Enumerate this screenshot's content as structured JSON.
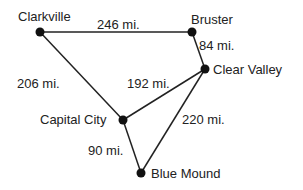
{
  "diagram": {
    "type": "weighted-graph",
    "colors": {
      "edge": "#222222",
      "node": "#111111",
      "text": "#222222",
      "background": "#ffffff"
    },
    "nodes": [
      {
        "id": "clarkville",
        "label": "Clarkville"
      },
      {
        "id": "bruster",
        "label": "Bruster"
      },
      {
        "id": "clear_valley",
        "label": "Clear Valley"
      },
      {
        "id": "capital_city",
        "label": "Capital City"
      },
      {
        "id": "blue_mound",
        "label": "Blue Mound"
      }
    ],
    "edges": [
      {
        "from": "Clarkville",
        "to": "Bruster",
        "label": "246 mi."
      },
      {
        "from": "Bruster",
        "to": "Clear Valley",
        "label": "84 mi."
      },
      {
        "from": "Clarkville",
        "to": "Capital City",
        "label": "206 mi."
      },
      {
        "from": "Clear Valley",
        "to": "Capital City",
        "label": "192 mi."
      },
      {
        "from": "Clear Valley",
        "to": "Blue Mound",
        "label": "220 mi."
      },
      {
        "from": "Capital City",
        "to": "Blue Mound",
        "label": "90 mi."
      }
    ]
  }
}
